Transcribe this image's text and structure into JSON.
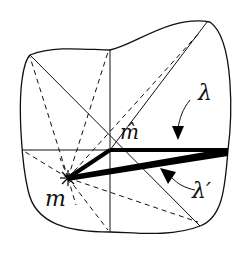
{
  "diagram": {
    "labels": {
      "m_hat": "m̂",
      "m": "m",
      "lambda": "λ",
      "lambda_prime": "λ′"
    },
    "colors": {
      "stroke": "#111111",
      "background": "#ffffff"
    }
  }
}
